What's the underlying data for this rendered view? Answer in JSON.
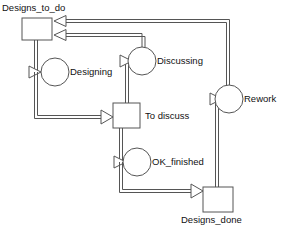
{
  "diagram": {
    "type": "petri-net",
    "title": "",
    "colors": {
      "stroke": "#555555",
      "text": "#111111",
      "background": "#ffffff"
    },
    "places": [
      {
        "id": "designs_to_do",
        "label": "Designs_to_do",
        "shape": "rectangle",
        "x": 22,
        "y": 18,
        "w": 30,
        "h": 22,
        "label_x": 2,
        "label_y": 4
      },
      {
        "id": "to_discuss",
        "label": "To discuss",
        "shape": "rectangle",
        "x": 113,
        "y": 103,
        "w": 27,
        "h": 25,
        "label_x": 145,
        "label_y": 110
      },
      {
        "id": "designs_done",
        "label": "Designs_done",
        "shape": "rectangle",
        "x": 203,
        "y": 187,
        "w": 30,
        "h": 25,
        "label_x": 181,
        "label_y": 214
      }
    ],
    "transitions": [
      {
        "id": "designing",
        "label": "Designing",
        "shape": "circle",
        "cx": 55,
        "cy": 72,
        "r": 14,
        "label_x": 70,
        "label_y": 66
      },
      {
        "id": "discussing",
        "label": "Discussing",
        "shape": "circle",
        "cx": 142,
        "cy": 61,
        "r": 14,
        "label_x": 157,
        "label_y": 55
      },
      {
        "id": "rework",
        "label": "Rework",
        "shape": "circle",
        "cx": 229,
        "cy": 99,
        "r": 14,
        "label_x": 244,
        "label_y": 93
      },
      {
        "id": "ok_finished",
        "label": "OK_finished",
        "shape": "circle",
        "cx": 137,
        "cy": 162,
        "r": 14,
        "label_x": 152,
        "label_y": 156
      }
    ],
    "arcs": [
      {
        "id": "arc-designs_to_do-designing",
        "from": "designs_to_do",
        "to": "designing",
        "style": "double-line"
      },
      {
        "id": "arc-designing-to_discuss",
        "from": "designing",
        "to": "to_discuss",
        "style": "double-line"
      },
      {
        "id": "arc-to_discuss-discussing",
        "from": "to_discuss",
        "to": "discussing",
        "style": "double-line"
      },
      {
        "id": "arc-discussing-designs_to_do",
        "from": "discussing",
        "to": "designs_to_do",
        "style": "double-line"
      },
      {
        "id": "arc-to_discuss-ok_finished",
        "from": "to_discuss",
        "to": "ok_finished",
        "style": "double-line"
      },
      {
        "id": "arc-ok_finished-designs_done",
        "from": "ok_finished",
        "to": "designs_done",
        "style": "double-line"
      },
      {
        "id": "arc-designs_done-rework",
        "from": "designs_done",
        "to": "rework",
        "style": "double-line"
      },
      {
        "id": "arc-rework-designs_to_do",
        "from": "rework",
        "to": "designs_to_do",
        "style": "double-line"
      }
    ]
  }
}
